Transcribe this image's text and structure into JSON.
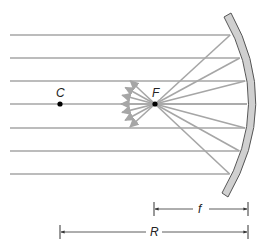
{
  "diagram": {
    "points": {
      "center": {
        "label": "C",
        "x": 60,
        "y": 104
      },
      "focus": {
        "label": "F",
        "x": 155,
        "y": 104
      }
    },
    "incident_ray_ys": [
      35,
      58,
      81,
      104,
      128,
      151,
      174
    ],
    "mirror": {
      "top": [
        228,
        15
      ],
      "apex": [
        250,
        104
      ],
      "bottom": [
        226,
        195
      ],
      "fill": "#d0d0d0",
      "stroke": "#555555"
    },
    "dimensions": {
      "focal_length": {
        "label": "f",
        "x1": 154,
        "x2": 248,
        "y": 209
      },
      "radius": {
        "label": "R",
        "x1": 60,
        "x2": 248,
        "y": 232
      }
    },
    "colors": {
      "ray": "#a6a6a6",
      "point": "#000000",
      "dimension": "#333333"
    }
  }
}
